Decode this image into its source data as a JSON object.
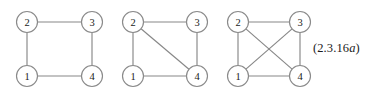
{
  "figure": {
    "label": "graph-sequence-figure",
    "background_color": "#ffffff",
    "edge_color": "#878787",
    "node_stroke_color": "#8a8a8a",
    "node_fill_color": "#ffffff",
    "label_color": "#1b1b1b",
    "node_radius": 10.5,
    "equation_number": {
      "prefix": "(2.3.16",
      "suffix_italic": "a",
      "closing": ")",
      "full": "(2.3.16a)"
    },
    "graphs": [
      {
        "name": "graph-1",
        "vertex_count": 4,
        "edge_count": 4,
        "description": "4-cycle",
        "nodes": [
          {
            "id": "2",
            "label": "2",
            "x": 27,
            "y": 22
          },
          {
            "id": "3",
            "label": "3",
            "x": 92,
            "y": 22
          },
          {
            "id": "1",
            "label": "1",
            "x": 27,
            "y": 76
          },
          {
            "id": "4",
            "label": "4",
            "x": 92,
            "y": 76
          }
        ],
        "edges": [
          {
            "from": "2",
            "to": "3"
          },
          {
            "from": "2",
            "to": "1"
          },
          {
            "from": "3",
            "to": "4"
          },
          {
            "from": "1",
            "to": "4"
          }
        ]
      },
      {
        "name": "graph-2",
        "vertex_count": 4,
        "edge_count": 5,
        "description": "4-cycle with one diagonal",
        "nodes": [
          {
            "id": "2",
            "label": "2",
            "x": 133,
            "y": 22
          },
          {
            "id": "3",
            "label": "3",
            "x": 197,
            "y": 22
          },
          {
            "id": "1",
            "label": "1",
            "x": 133,
            "y": 76
          },
          {
            "id": "4",
            "label": "4",
            "x": 197,
            "y": 76
          }
        ],
        "edges": [
          {
            "from": "2",
            "to": "3"
          },
          {
            "from": "2",
            "to": "1"
          },
          {
            "from": "3",
            "to": "4"
          },
          {
            "from": "1",
            "to": "4"
          },
          {
            "from": "2",
            "to": "4"
          }
        ]
      },
      {
        "name": "graph-3",
        "vertex_count": 4,
        "edge_count": 6,
        "description": "complete graph on four vertices",
        "nodes": [
          {
            "id": "2",
            "label": "2",
            "x": 238,
            "y": 22
          },
          {
            "id": "3",
            "label": "3",
            "x": 300,
            "y": 22
          },
          {
            "id": "1",
            "label": "1",
            "x": 238,
            "y": 76
          },
          {
            "id": "4",
            "label": "4",
            "x": 300,
            "y": 76
          }
        ],
        "edges": [
          {
            "from": "2",
            "to": "3"
          },
          {
            "from": "2",
            "to": "1"
          },
          {
            "from": "3",
            "to": "4"
          },
          {
            "from": "1",
            "to": "4"
          },
          {
            "from": "2",
            "to": "4"
          },
          {
            "from": "1",
            "to": "3"
          }
        ]
      }
    ]
  }
}
